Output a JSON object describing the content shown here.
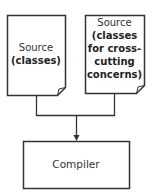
{
  "diagram": {
    "nodes": [
      {
        "id": "source-classes",
        "shape": "document",
        "line1": "Source",
        "line2": "(classes)"
      },
      {
        "id": "source-crosscutting",
        "shape": "document",
        "line1": "Source",
        "line2": "(classes",
        "line3": "for cross-",
        "line4": "cutting",
        "line5": "concerns)"
      },
      {
        "id": "compiler",
        "shape": "rectangle",
        "label": "Compiler"
      }
    ],
    "edges": [
      {
        "from": "source-classes",
        "to": "compiler",
        "style": "elbow-merge"
      },
      {
        "from": "source-crosscutting",
        "to": "compiler",
        "style": "elbow-merge",
        "arrow": "end"
      }
    ],
    "colors": {
      "stroke": "#333333",
      "fill": "#ffffff",
      "text": "#222222"
    }
  }
}
